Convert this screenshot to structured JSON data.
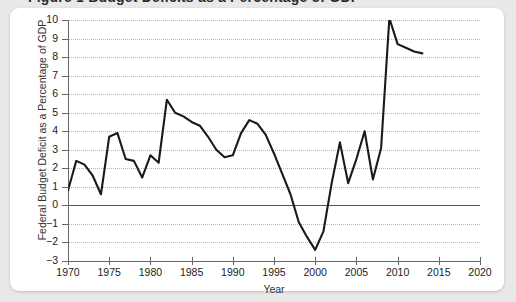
{
  "title_strip": {
    "text": "Figure 1  Budget Deficits as a Percentage of GDP"
  },
  "axis": {
    "y_title": "Federal Budget Deficit as a Percentage of GDP",
    "x_title": "Year",
    "y_ticks": [
      "10",
      "9",
      "8",
      "7",
      "6",
      "5",
      "4",
      "3",
      "2",
      "1",
      "0",
      "−1",
      "−2",
      "−3"
    ],
    "x_ticks": [
      "1970",
      "1975",
      "1980",
      "1985",
      "1990",
      "1995",
      "2000",
      "2005",
      "2010",
      "2015",
      "2020"
    ]
  },
  "style": {
    "line_color": "#1a1a1a",
    "grid_color": "#b5b5b5",
    "zero_line_color": "#555555",
    "axis_color": "#666666",
    "card_background": "#ffffff",
    "page_background": "#e8e8e8"
  },
  "chart_data": {
    "type": "line",
    "title": "Federal Budget Deficit as a Percentage of GDP",
    "xlabel": "Year",
    "ylabel": "Federal Budget Deficit as a Percentage of GDP",
    "xlim": [
      1970,
      2020
    ],
    "ylim": [
      -3,
      10
    ],
    "grid": true,
    "legend": "none",
    "zero_reference_line": 0,
    "series": [
      {
        "name": "Federal Budget Deficit (% of GDP)",
        "x": [
          1970,
          1971,
          1972,
          1973,
          1974,
          1975,
          1976,
          1977,
          1978,
          1979,
          1980,
          1981,
          1982,
          1983,
          1984,
          1985,
          1986,
          1987,
          1988,
          1989,
          1990,
          1991,
          1992,
          1993,
          1994,
          1995,
          1996,
          1997,
          1998,
          1999,
          2000,
          2001,
          2002,
          2003,
          2004,
          2005,
          2006,
          2007,
          2008,
          2009,
          2010,
          2011,
          2012,
          2013
        ],
        "values": [
          0.8,
          2.4,
          2.2,
          1.6,
          0.6,
          3.7,
          3.9,
          2.5,
          2.4,
          1.5,
          2.7,
          2.3,
          5.7,
          5.0,
          4.8,
          4.5,
          4.3,
          3.7,
          3.0,
          2.6,
          2.7,
          3.9,
          4.6,
          4.4,
          3.8,
          2.8,
          1.7,
          0.6,
          -0.9,
          -1.7,
          -2.4,
          -1.4,
          1.2,
          3.4,
          1.2,
          2.5,
          4.0,
          1.4,
          3.1,
          10.1,
          8.7,
          8.5,
          8.3,
          8.2
        ]
      }
    ]
  }
}
